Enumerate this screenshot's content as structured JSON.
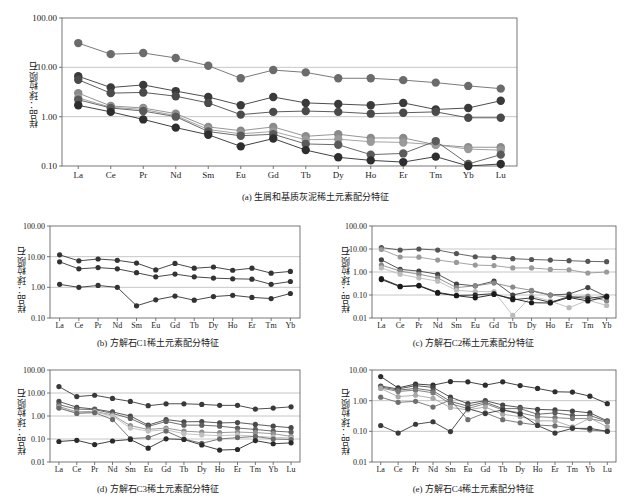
{
  "figure": {
    "axis_y_label": "样品：球粒陨石",
    "panels_count": 5
  },
  "chart_data": [
    {
      "id": "panel-a",
      "type": "line",
      "title": "",
      "caption": "(a) 生屑和基质灰泥稀土元素配分特征",
      "xlabel": "",
      "ylabel": "样品：球粒陨石",
      "yscale": "log",
      "ylim": [
        0.1,
        100.0
      ],
      "yticks": [
        "100.00",
        "10.00",
        "1.00",
        "0.10"
      ],
      "ytick_values": [
        100.0,
        10.0,
        1.0,
        0.1
      ],
      "grid": true,
      "legend": "none",
      "categories": [
        "La",
        "Ce",
        "Pr",
        "Nd",
        "Sm",
        "Eu",
        "Gd",
        "Tb",
        "Dy",
        "Ho",
        "Er",
        "Tm",
        "Yb",
        "Lu"
      ],
      "series": [
        {
          "name": "S1",
          "color": "#6b6b6b",
          "values": [
            31.0,
            18.5,
            19.5,
            15.5,
            10.8,
            6.0,
            8.8,
            7.9,
            6.0,
            6.0,
            5.5,
            4.9,
            4.2,
            3.7
          ]
        },
        {
          "name": "S2",
          "color": "#3a3a3a",
          "values": [
            6.6,
            3.9,
            4.4,
            3.3,
            2.5,
            1.7,
            2.5,
            1.9,
            1.8,
            1.7,
            1.9,
            1.4,
            1.5,
            2.1
          ]
        },
        {
          "name": "S3",
          "color": "#4a4a4a",
          "values": [
            5.6,
            3.0,
            3.1,
            2.6,
            1.9,
            1.1,
            1.25,
            1.3,
            1.25,
            1.15,
            1.2,
            1.25,
            0.95,
            0.95
          ]
        },
        {
          "name": "S4",
          "color": "#8a8a8a",
          "values": [
            3.0,
            1.65,
            1.5,
            1.15,
            0.62,
            0.52,
            0.62,
            0.4,
            0.44,
            0.37,
            0.37,
            0.27,
            0.24,
            0.24
          ]
        },
        {
          "name": "S5",
          "color": "#9a9a9a",
          "values": [
            2.4,
            1.55,
            1.4,
            1.05,
            0.55,
            0.45,
            0.5,
            0.34,
            0.35,
            0.31,
            0.3,
            0.27,
            0.22,
            0.21
          ]
        },
        {
          "name": "S6",
          "color": "#5a5a5a",
          "values": [
            2.2,
            1.5,
            1.3,
            1.0,
            0.5,
            0.41,
            0.44,
            0.28,
            0.27,
            0.17,
            0.18,
            0.32,
            0.11,
            0.17
          ]
        },
        {
          "name": "S7",
          "color": "#2e2e2e",
          "values": [
            1.7,
            1.25,
            0.88,
            0.6,
            0.43,
            0.25,
            0.36,
            0.21,
            0.15,
            0.13,
            0.12,
            0.155,
            0.1,
            0.11
          ]
        }
      ]
    },
    {
      "id": "panel-b",
      "type": "line",
      "title": "",
      "caption": "(b) 方解石C1稀土元素配分特征",
      "xlabel": "",
      "ylabel": "样品：球粒陨石",
      "yscale": "log",
      "ylim": [
        0.1,
        100.0
      ],
      "yticks": [
        "100.00",
        "10.00",
        "1.00",
        "0.10"
      ],
      "ytick_values": [
        100.0,
        10.0,
        1.0,
        0.1
      ],
      "grid": true,
      "legend": "none",
      "categories": [
        "La",
        "Ce",
        "Pr",
        "Nd",
        "Sm",
        "Eu",
        "Gd",
        "Tb",
        "Dy",
        "Ho",
        "Er",
        "Tm",
        "Yb"
      ],
      "series": [
        {
          "name": "S1",
          "color": "#333333",
          "values": [
            11.5,
            7.3,
            8.4,
            7.6,
            6.2,
            3.7,
            6.0,
            4.2,
            4.6,
            3.6,
            4.2,
            2.9,
            3.3
          ]
        },
        {
          "name": "S2",
          "color": "#333333",
          "values": [
            6.8,
            4.0,
            4.4,
            4.0,
            3.0,
            2.2,
            2.7,
            2.2,
            2.0,
            1.9,
            1.85,
            1.25,
            1.55
          ]
        },
        {
          "name": "S3",
          "color": "#333333",
          "values": [
            1.25,
            1.0,
            1.15,
            1.0,
            0.25,
            0.39,
            0.52,
            0.38,
            0.5,
            0.55,
            0.47,
            0.43,
            0.63
          ]
        }
      ]
    },
    {
      "id": "panel-c",
      "type": "line",
      "title": "",
      "caption": "(c) 方解石C2稀土元素配分特征",
      "xlabel": "",
      "ylabel": "样品：球粒陨石",
      "yscale": "log",
      "ylim": [
        0.01,
        100.0
      ],
      "yticks": [
        "100.00",
        "10.00",
        "1.00",
        "0.10",
        "0.01"
      ],
      "ytick_values": [
        100.0,
        10.0,
        1.0,
        0.1,
        0.01
      ],
      "grid": true,
      "legend": "none",
      "categories": [
        "La",
        "Ce",
        "Pr",
        "Nd",
        "Sm",
        "Eu",
        "Gd",
        "Tb",
        "Dy",
        "Ho",
        "Er",
        "Tm",
        "Yb"
      ],
      "series": [
        {
          "name": "S1",
          "color": "#555555",
          "values": [
            11.5,
            9.0,
            10.0,
            9.0,
            6.3,
            4.6,
            4.3,
            3.8,
            3.5,
            3.3,
            3.1,
            2.9,
            2.8
          ]
        },
        {
          "name": "S2",
          "color": "#9a9a9a",
          "values": [
            9.5,
            4.5,
            4.4,
            3.3,
            2.6,
            2.0,
            1.9,
            1.5,
            1.5,
            1.3,
            1.25,
            0.9,
            1.0
          ]
        },
        {
          "name": "S3",
          "color": "#444444",
          "values": [
            3.4,
            1.3,
            1.1,
            0.8,
            0.3,
            0.25,
            0.4,
            0.1,
            0.15,
            0.1,
            0.11,
            0.21,
            0.085
          ]
        },
        {
          "name": "S4",
          "color": "#888888",
          "values": [
            2.0,
            1.1,
            0.8,
            0.55,
            0.21,
            0.25,
            0.33,
            0.22,
            0.16,
            0.1,
            0.08,
            0.09,
            0.055
          ]
        },
        {
          "name": "S5",
          "color": "#bbbbbb",
          "values": [
            1.5,
            0.8,
            0.55,
            0.4,
            0.16,
            0.14,
            0.14,
            0.013,
            0.09,
            0.055,
            0.028,
            0.06,
            0.035
          ]
        },
        {
          "name": "S6",
          "color": "#2a2a2a",
          "values": [
            0.52,
            0.24,
            0.26,
            0.13,
            0.095,
            0.1,
            0.115,
            0.062,
            0.075,
            0.048,
            0.085,
            0.07,
            0.09
          ]
        },
        {
          "name": "S7",
          "color": "#1a1a1a",
          "values": [
            0.47,
            0.23,
            0.25,
            0.12,
            0.093,
            0.075,
            0.105,
            0.07,
            0.046,
            0.045,
            0.078,
            0.055,
            0.082
          ]
        }
      ]
    },
    {
      "id": "panel-d",
      "type": "line",
      "title": "",
      "caption": "(d) 方解石C3稀土元素配分特征",
      "xlabel": "",
      "ylabel": "样品：球粒陨石",
      "yscale": "log",
      "ylim": [
        0.01,
        100.0
      ],
      "yticks": [
        "100.00",
        "10.00",
        "1.00",
        "0.10",
        "0.01"
      ],
      "ytick_values": [
        100.0,
        10.0,
        1.0,
        0.1,
        0.01
      ],
      "grid": true,
      "legend": "none",
      "categories": [
        "La",
        "Ce",
        "Pr",
        "Nd",
        "Sm",
        "Eu",
        "Gd",
        "Tb",
        "Dy",
        "Ho",
        "Er",
        "Tm",
        "Yb",
        "Lu"
      ],
      "series": [
        {
          "name": "S1",
          "color": "#3a3a3a",
          "values": [
            19.0,
            7.0,
            8.0,
            5.8,
            4.3,
            2.8,
            3.4,
            3.4,
            3.2,
            2.9,
            2.9,
            2.0,
            2.2,
            2.5
          ]
        },
        {
          "name": "S2",
          "color": "#4a4a4a",
          "values": [
            4.3,
            2.4,
            2.0,
            1.5,
            1.0,
            0.4,
            0.7,
            0.56,
            0.57,
            0.5,
            0.52,
            0.43,
            0.36,
            0.31
          ]
        },
        {
          "name": "S3",
          "color": "#5f5f5f",
          "values": [
            3.1,
            2.0,
            1.9,
            1.3,
            0.78,
            0.35,
            0.58,
            0.4,
            0.4,
            0.36,
            0.3,
            0.26,
            0.22,
            0.2
          ]
        },
        {
          "name": "S4",
          "color": "#8f8f8f",
          "values": [
            2.6,
            1.5,
            1.6,
            1.1,
            0.38,
            0.26,
            0.3,
            0.22,
            0.2,
            0.19,
            0.2,
            0.19,
            0.17,
            0.13
          ]
        },
        {
          "name": "S5",
          "color": "#c0c0c0",
          "values": [
            2.3,
            1.35,
            1.5,
            1.0,
            0.3,
            0.22,
            0.25,
            0.17,
            0.15,
            0.14,
            0.15,
            0.13,
            0.12,
            0.11
          ]
        },
        {
          "name": "S6",
          "color": "#6a6a6a",
          "values": [
            2.2,
            1.3,
            1.4,
            0.7,
            0.105,
            0.115,
            0.22,
            0.1,
            0.065,
            0.1,
            0.115,
            0.13,
            0.1,
            0.095
          ]
        },
        {
          "name": "S7",
          "color": "#2a2a2a",
          "values": [
            0.078,
            0.088,
            0.057,
            0.082,
            0.095,
            0.04,
            0.102,
            0.095,
            0.055,
            0.033,
            0.035,
            0.085,
            0.062,
            0.068
          ]
        }
      ]
    },
    {
      "id": "panel-e",
      "type": "line",
      "title": "",
      "caption": "(e) 方解石C4稀土元素配分特征",
      "xlabel": "",
      "ylabel": "样品：球粒陨石",
      "yscale": "log",
      "ylim": [
        0.01,
        10.0
      ],
      "yticks": [
        "10.00",
        "1.00",
        "0.10",
        "0.01"
      ],
      "ytick_values": [
        10.0,
        1.0,
        0.1,
        0.01
      ],
      "grid": true,
      "legend": "none",
      "categories": [
        "La",
        "Ce",
        "Pr",
        "Nd",
        "Sm",
        "Eu",
        "Gd",
        "Tb",
        "Dy",
        "Ho",
        "Er",
        "Tm",
        "Yb",
        "Lu"
      ],
      "series": [
        {
          "name": "S1",
          "color": "#2e2e2e",
          "values": [
            6.1,
            2.6,
            3.5,
            3.2,
            4.2,
            4.1,
            3.2,
            4.1,
            3.1,
            2.5,
            1.95,
            1.9,
            1.4,
            0.8
          ]
        },
        {
          "name": "S2",
          "color": "#444444",
          "values": [
            3.0,
            2.4,
            3.1,
            2.7,
            1.3,
            0.8,
            1.0,
            0.72,
            0.6,
            0.52,
            0.5,
            0.46,
            0.4,
            0.22
          ]
        },
        {
          "name": "S3",
          "color": "#5c5c5c",
          "values": [
            2.8,
            2.2,
            2.5,
            2.1,
            0.95,
            0.66,
            0.9,
            0.55,
            0.55,
            0.36,
            0.4,
            0.33,
            0.33,
            0.21
          ]
        },
        {
          "name": "S4",
          "color": "#787878",
          "values": [
            2.6,
            2.0,
            2.2,
            1.8,
            0.8,
            0.55,
            0.8,
            0.5,
            0.4,
            0.3,
            0.28,
            0.26,
            0.26,
            0.2
          ]
        },
        {
          "name": "S5",
          "color": "#a8a8a8",
          "values": [
            2.5,
            1.35,
            1.5,
            1.2,
            0.6,
            0.5,
            0.62,
            0.36,
            0.3,
            0.22,
            0.22,
            0.14,
            0.27,
            0.14
          ]
        },
        {
          "name": "S6",
          "color": "#6f6f6f",
          "values": [
            1.3,
            0.88,
            0.95,
            0.62,
            1.05,
            0.24,
            0.4,
            0.24,
            0.19,
            0.16,
            0.15,
            0.13,
            0.11,
            0.1
          ]
        },
        {
          "name": "S7",
          "color": "#3a3a3a",
          "values": [
            0.155,
            0.088,
            0.17,
            0.205,
            0.098,
            0.55,
            0.38,
            0.5,
            0.37,
            0.155,
            0.088,
            0.125,
            0.125,
            0.1
          ]
        }
      ]
    }
  ]
}
